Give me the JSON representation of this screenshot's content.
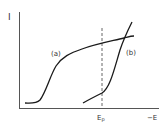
{
  "diagram": {
    "y_axis_label": "I",
    "x_axis_label": "−E",
    "marker_label": "E",
    "marker_subscript": "p",
    "curve_a_label": "(a)",
    "curve_b_label": "(b)",
    "colors": {
      "line": "#1a1a1a",
      "axis": "#555555",
      "dashed": "#666666",
      "text": "#333333"
    }
  }
}
